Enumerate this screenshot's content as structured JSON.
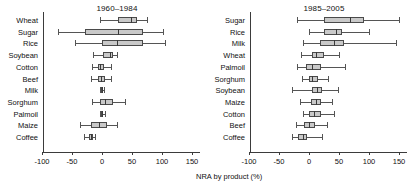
{
  "figure": {
    "xlabel": "NRA by product (%)",
    "box_fill": "#c9c9c9",
    "box_edge": "#4a4a4a",
    "axis_color": "#3b3b3b"
  },
  "chart_data": {
    "type": "box",
    "title": "",
    "xlabel": "NRA by product (%)",
    "ylabel": "",
    "xlim": [
      -110,
      160
    ],
    "xticks": [
      -100,
      -50,
      0,
      50,
      100,
      150
    ],
    "xticklabels": [
      "-100",
      "-50",
      "0",
      "50",
      "100",
      "150"
    ],
    "grid": false,
    "legend": null,
    "orientation": "horizontal",
    "panels": [
      {
        "title": "1960–1984",
        "categories": [
          "Wheat",
          "Sugar",
          "Rice",
          "Soybean",
          "Cotton",
          "Beef",
          "Milk",
          "Sorghum",
          "Palmoil",
          "Maize",
          "Coffee"
        ],
        "boxes": [
          {
            "label": "Wheat",
            "whisker_low": -3,
            "q1": 27,
            "median": 48,
            "q3": 58,
            "whisker_high": 75
          },
          {
            "label": "Sugar",
            "whisker_low": -73,
            "q1": -28,
            "median": 27,
            "q3": 68,
            "whisker_high": 102
          },
          {
            "label": "Rice",
            "whisker_low": -45,
            "q1": 0,
            "median": 25,
            "q3": 68,
            "whisker_high": 105
          },
          {
            "label": "Soybean",
            "whisker_low": -15,
            "q1": 2,
            "median": 13,
            "q3": 18,
            "whisker_high": 25
          },
          {
            "label": "Cotton",
            "whisker_low": -17,
            "q1": -7,
            "median": -3,
            "q3": 3,
            "whisker_high": 15
          },
          {
            "label": "Beef",
            "whisker_low": -18,
            "q1": -7,
            "median": -2,
            "q3": 5,
            "whisker_high": 15
          },
          {
            "label": "Milk",
            "whisker_low": -3,
            "q1": -1,
            "median": 0,
            "q3": 1,
            "whisker_high": 3
          },
          {
            "label": "Sorghum",
            "whisker_low": -17,
            "q1": -3,
            "median": 5,
            "q3": 18,
            "whisker_high": 38
          },
          {
            "label": "Palmoil",
            "whisker_low": -4,
            "q1": -1,
            "median": 0,
            "q3": 2,
            "whisker_high": 5
          },
          {
            "label": "Maize",
            "whisker_low": -37,
            "q1": -18,
            "median": -5,
            "q3": 8,
            "whisker_high": 25
          },
          {
            "label": "Coffee",
            "whisker_low": -30,
            "q1": -22,
            "median": -18,
            "q3": -15,
            "whisker_high": -12
          }
        ]
      },
      {
        "title": "1985–2005",
        "categories": [
          "Sugar",
          "Rice",
          "Milk",
          "Wheat",
          "Palmoil",
          "Sorghum",
          "Soybean",
          "Maize",
          "Cotton",
          "Beef",
          "Coffee"
        ],
        "boxes": [
          {
            "label": "Sugar",
            "whisker_low": -20,
            "q1": 25,
            "median": 68,
            "q3": 92,
            "whisker_high": 150
          },
          {
            "label": "Rice",
            "whisker_low": 0,
            "q1": 25,
            "median": 45,
            "q3": 55,
            "whisker_high": 100
          },
          {
            "label": "Milk",
            "whisker_low": -10,
            "q1": 18,
            "median": 42,
            "q3": 58,
            "whisker_high": 145
          },
          {
            "label": "Wheat",
            "whisker_low": -13,
            "q1": 5,
            "median": 12,
            "q3": 25,
            "whisker_high": 50
          },
          {
            "label": "Palmoil",
            "whisker_low": -20,
            "q1": -5,
            "median": 5,
            "q3": 20,
            "whisker_high": 60
          },
          {
            "label": "Sorghum",
            "whisker_low": -12,
            "q1": 0,
            "median": 5,
            "q3": 15,
            "whisker_high": 32
          },
          {
            "label": "Soybean",
            "whisker_low": -28,
            "q1": 5,
            "median": 13,
            "q3": 22,
            "whisker_high": 48
          },
          {
            "label": "Maize",
            "whisker_low": -15,
            "q1": 3,
            "median": 12,
            "q3": 20,
            "whisker_high": 38
          },
          {
            "label": "Cotton",
            "whisker_low": -10,
            "q1": 0,
            "median": 8,
            "q3": 20,
            "whisker_high": 42
          },
          {
            "label": "Beef",
            "whisker_low": -22,
            "q1": -8,
            "median": 0,
            "q3": 10,
            "whisker_high": 30
          },
          {
            "label": "Coffee",
            "whisker_low": -28,
            "q1": -18,
            "median": -10,
            "q3": -3,
            "whisker_high": 22
          }
        ]
      }
    ]
  }
}
